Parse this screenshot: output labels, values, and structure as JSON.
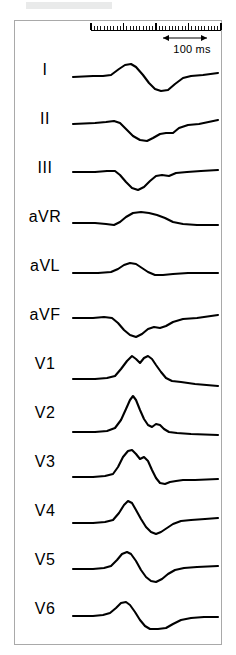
{
  "figure": {
    "type": "ecg-12-lead-strip",
    "background_color": "#ffffff",
    "frame_color": "#a9a9a9",
    "trace_color": "#000000",
    "top_bar_color": "#e9eaea"
  },
  "scale": {
    "label": "100 ms",
    "ruler_major_ticks": 4,
    "ruler_minor_per_major": 10,
    "arrow_icon": "double-arrow-icon"
  },
  "leads": [
    {
      "label": "I",
      "path": "M 0 26 L 20 25 L 30 25 L 38 24 L 46 18 L 52 14 L 58 13 L 63 16 L 70 24 L 76 32 L 82 38 L 88 40 L 95 39 L 102 33 L 110 27 L 118 25 L 130 24 L 145 22"
    },
    {
      "label": "II",
      "path": "M 0 24 L 22 23 L 33 22 L 41 21 L 47 23 L 53 29 L 60 36 L 67 40 L 74 41 L 80 38 L 87 34 L 93 33 L 100 33 L 106 28 L 115 25 L 126 24 L 145 20"
    },
    {
      "label": "III",
      "path": "M 0 23 L 22 23 L 34 22 L 42 22 L 47 26 L 53 33 L 59 39 L 65 41 L 71 38 L 77 32 L 83 27 L 89 26 L 96 27 L 103 24 L 114 23 L 128 22 L 145 21"
    },
    {
      "label": "aVR",
      "path": "M 0 25 L 22 25 L 33 26 L 41 27 L 47 24 L 53 19 L 60 15 L 68 14 L 76 15 L 84 17 L 92 20 L 100 24 L 110 26 L 124 27 L 145 27"
    },
    {
      "label": "aVL",
      "path": "M 0 26 L 25 26 L 38 25 L 45 22 L 51 18 L 57 16 L 63 17 L 69 21 L 75 25 L 82 28 L 90 28 L 100 27 L 115 26 L 130 26 L 145 26"
    },
    {
      "label": "aVF",
      "path": "M 0 22 L 20 22 L 31 21 L 39 22 L 45 27 L 51 34 L 57 39 L 63 41 L 69 38 L 75 33 L 81 31 L 87 32 L 93 30 L 100 26 L 110 23 L 124 22 L 145 19"
    },
    {
      "label": "V1",
      "path": "M 0 34 L 22 34 L 34 33 L 42 31 L 48 24 L 54 16 L 59 11 L 63 14 L 67 18 L 71 13 L 75 11 L 79 14 L 83 20 L 88 27 L 93 33 L 99 36 L 108 37 L 122 39 L 145 41"
    },
    {
      "label": "V2",
      "path": "M 0 38 L 22 38 L 34 37 L 42 34 L 48 26 L 53 15 L 57 6 L 60 2 L 63 6 L 67 16 L 71 25 L 75 31 L 79 33 L 83 30 L 87 31 L 91 35 L 96 38 L 104 39 L 118 40 L 145 41"
    },
    {
      "label": "V3",
      "path": "M 0 34 L 20 34 L 32 33 L 40 31 L 45 24 L 50 14 L 55 8 L 59 7 L 63 11 L 67 16 L 71 14 L 75 18 L 79 27 L 83 35 L 87 40 L 92 41 L 97 39 L 103 38 L 110 37 L 122 37 L 145 36"
    },
    {
      "label": "V4",
      "path": "M 0 31 L 20 31 L 32 30 L 40 28 L 46 21 L 51 13 L 55 9 L 59 11 L 63 18 L 68 27 L 73 35 L 78 40 L 83 42 L 88 40 L 94 36 L 100 32 L 108 29 L 118 28 L 132 27 L 145 26"
    },
    {
      "label": "V5",
      "path": "M 0 28 L 20 28 L 31 27 L 38 25 L 44 19 L 49 13 L 54 11 L 58 13 L 63 20 L 68 29 L 73 36 L 78 40 L 83 41 L 89 38 L 95 33 L 102 29 L 111 27 L 124 26 L 145 25"
    },
    {
      "label": "V6",
      "path": "M 0 26 L 20 26 L 30 25 L 37 23 L 43 18 L 48 13 L 53 12 L 57 15 L 62 22 L 67 30 L 72 36 L 77 39 L 85 39 L 93 38 L 100 34 L 108 30 L 118 28 L 131 27 L 145 27"
    }
  ]
}
